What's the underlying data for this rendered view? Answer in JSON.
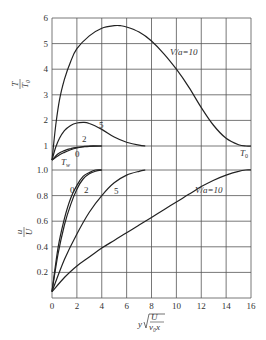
{
  "chart_data": [
    {
      "type": "line",
      "title": "",
      "xlabel": "y√(U/ν₀x)",
      "ylabel": "T/T₀",
      "ylabel_num": "T",
      "ylabel_den": "T₀",
      "xlim": [
        0,
        16
      ],
      "ylim": [
        0.35,
        6
      ],
      "grid": true,
      "yticks": [
        "1",
        "2",
        "3",
        "4",
        "5",
        "6"
      ],
      "annotations": [
        "V/a=10",
        "5",
        "2",
        "0",
        "Tw",
        "T0"
      ],
      "series": [
        {
          "name": "V/a=10",
          "x": [
            0,
            0.3,
            0.6,
            1,
            1.5,
            2,
            3,
            4,
            5,
            5.5,
            6,
            7,
            8,
            9,
            10,
            11,
            12,
            13,
            14,
            15,
            15.6,
            16
          ],
          "y": [
            0.45,
            1.8,
            2.8,
            3.6,
            4.3,
            4.8,
            5.3,
            5.6,
            5.7,
            5.7,
            5.65,
            5.45,
            5.1,
            4.6,
            4.0,
            3.3,
            2.5,
            1.8,
            1.3,
            1.05,
            1.0,
            1.0
          ]
        },
        {
          "name": "5",
          "x": [
            0,
            0.3,
            0.6,
            1,
            1.5,
            2,
            2.5,
            3,
            4,
            5,
            6,
            7,
            7.5
          ],
          "y": [
            0.45,
            0.95,
            1.3,
            1.6,
            1.8,
            1.9,
            1.92,
            1.88,
            1.65,
            1.35,
            1.15,
            1.03,
            1.0
          ]
        },
        {
          "name": "2",
          "x": [
            0,
            0.5,
            1,
            1.5,
            2,
            2.5,
            3,
            4
          ],
          "y": [
            0.45,
            0.7,
            0.82,
            0.9,
            0.95,
            0.98,
            1.0,
            1.0
          ]
        },
        {
          "name": "0",
          "x": [
            0,
            0.5,
            1,
            1.5,
            2,
            2.5,
            3,
            4
          ],
          "y": [
            0.45,
            0.62,
            0.75,
            0.85,
            0.92,
            0.96,
            0.99,
            1.0
          ]
        }
      ]
    },
    {
      "type": "line",
      "title": "",
      "xlabel": "y√(U/ν₀x)",
      "ylabel": "u/U",
      "ylabel_num": "u",
      "ylabel_den": "U",
      "xlim": [
        0,
        16
      ],
      "ylim": [
        0,
        1.0
      ],
      "grid": true,
      "xticks": [
        "0",
        "2",
        "4",
        "6",
        "8",
        "10",
        "12",
        "14",
        "16"
      ],
      "yticks": [
        "0.2",
        "0.4",
        "0.6",
        "0.8",
        "1.0"
      ],
      "annotations": [
        "0",
        "2",
        "5",
        "V/a=10"
      ],
      "series": [
        {
          "name": "0",
          "x": [
            0,
            0.5,
            1,
            1.5,
            2,
            2.5,
            3,
            3.5,
            4
          ],
          "y": [
            0.05,
            0.4,
            0.62,
            0.78,
            0.88,
            0.95,
            0.98,
            1.0,
            1.0
          ]
        },
        {
          "name": "2",
          "x": [
            0,
            0.5,
            1,
            1.5,
            2,
            2.5,
            3,
            3.5,
            4
          ],
          "y": [
            0.05,
            0.35,
            0.57,
            0.73,
            0.85,
            0.93,
            0.97,
            0.99,
            1.0
          ]
        },
        {
          "name": "5",
          "x": [
            0,
            1,
            2,
            3,
            4,
            5,
            6,
            7,
            7.5
          ],
          "y": [
            0.05,
            0.3,
            0.5,
            0.67,
            0.8,
            0.9,
            0.96,
            0.99,
            1.0
          ]
        },
        {
          "name": "V/a=10",
          "x": [
            0,
            1,
            2,
            3,
            4,
            5,
            6,
            7,
            8,
            9,
            10,
            11,
            12,
            13,
            14,
            15,
            15.6,
            16
          ],
          "y": [
            0.05,
            0.16,
            0.25,
            0.32,
            0.39,
            0.45,
            0.51,
            0.57,
            0.63,
            0.69,
            0.75,
            0.81,
            0.87,
            0.92,
            0.96,
            0.99,
            1.0,
            1.0
          ]
        }
      ]
    }
  ],
  "labels": {
    "upper_va10": "V/a=10",
    "upper_5": "5",
    "upper_2": "2",
    "upper_0": "0",
    "upper_tw": "T",
    "upper_tw_sub": "w",
    "upper_t0": "T",
    "upper_t0_sub": "0",
    "lower_0": "0",
    "lower_2": "2",
    "lower_5": "5",
    "lower_va10": "V/a=10",
    "xlabel_y": "y",
    "xlabel_num": "U",
    "xlabel_den": "ν₀x",
    "y_upper_num": "T",
    "y_upper_den": "T₀",
    "y_lower_num": "u",
    "y_lower_den": "U"
  }
}
